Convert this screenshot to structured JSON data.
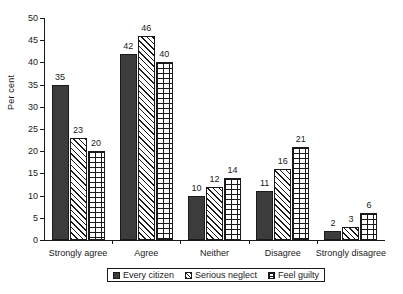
{
  "chart_data": {
    "type": "bar",
    "title": "",
    "xlabel": "",
    "ylabel": "Per cent",
    "ylim": [
      0,
      50
    ],
    "yticks": [
      0,
      5,
      10,
      15,
      20,
      25,
      30,
      35,
      40,
      45,
      50
    ],
    "grid": false,
    "legend_position": "bottom",
    "categories": [
      "Strongly agree",
      "Agree",
      "Neither",
      "Disagree",
      "Strongly disagree"
    ],
    "series": [
      {
        "name": "Every citizen",
        "pattern": "solid-dark",
        "color": "#3c3c3c",
        "values": [
          35,
          42,
          10,
          11,
          2
        ]
      },
      {
        "name": "Serious neglect",
        "pattern": "diagonal-hatch",
        "color": "#ffffff",
        "values": [
          23,
          46,
          12,
          16,
          3
        ]
      },
      {
        "name": "Feel guilty",
        "pattern": "brick",
        "color": "#ffffff",
        "values": [
          20,
          40,
          14,
          21,
          6
        ]
      }
    ]
  },
  "axis": {
    "y_title": "Per cent",
    "y_tick_labels": [
      "0",
      "5",
      "10",
      "15",
      "20",
      "25",
      "30",
      "35",
      "40",
      "45",
      "50"
    ]
  },
  "legend": {
    "items": [
      {
        "label": "Every citizen"
      },
      {
        "label": "Serious neglect"
      },
      {
        "label": "Feel guilty"
      }
    ]
  },
  "value_labels": {
    "strongly_agree": [
      "35",
      "23",
      "20"
    ],
    "agree": [
      "42",
      "46",
      "40"
    ],
    "neither": [
      "10",
      "12",
      "14"
    ],
    "disagree": [
      "11",
      "16",
      "21"
    ],
    "strongly_disagree": [
      "2",
      "3",
      "6"
    ]
  }
}
